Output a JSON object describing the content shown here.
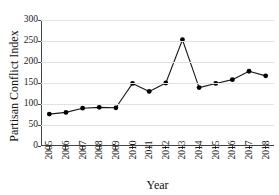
{
  "chart_data": {
    "type": "line",
    "title": "",
    "xlabel": "Year",
    "ylabel": "Partisan Conflict Index",
    "categories": [
      "2005",
      "2006",
      "2007",
      "2008",
      "2009",
      "2010",
      "2011",
      "2012",
      "2013",
      "2014",
      "2015",
      "2016",
      "2017",
      "2018"
    ],
    "x": [
      2005,
      2006,
      2007,
      2008,
      2009,
      2010,
      2011,
      2012,
      2013,
      2014,
      2015,
      2016,
      2017,
      2018
    ],
    "values": [
      76,
      80,
      90,
      92,
      91,
      149,
      130,
      150,
      253,
      139,
      149,
      158,
      178,
      167
    ],
    "series": [
      {
        "name": "Partisan Conflict Index",
        "values": [
          76,
          80,
          90,
          92,
          91,
          149,
          130,
          150,
          253,
          139,
          149,
          158,
          178,
          167
        ]
      }
    ],
    "ylim": [
      0,
      300
    ],
    "yticks": [
      0,
      50,
      100,
      150,
      200,
      250,
      300
    ],
    "ytick_labels": [
      "0",
      "50",
      "100",
      "150",
      "200",
      "250",
      "300"
    ],
    "xlim": [
      2004.5,
      2018.5
    ],
    "grid": "horizontal",
    "legend": "none",
    "marker": "filled-circle",
    "line_color": "#1a1a1a",
    "marker_color": "#000000",
    "grid_color": "#e2e2e2",
    "axis_color": "#444444"
  }
}
